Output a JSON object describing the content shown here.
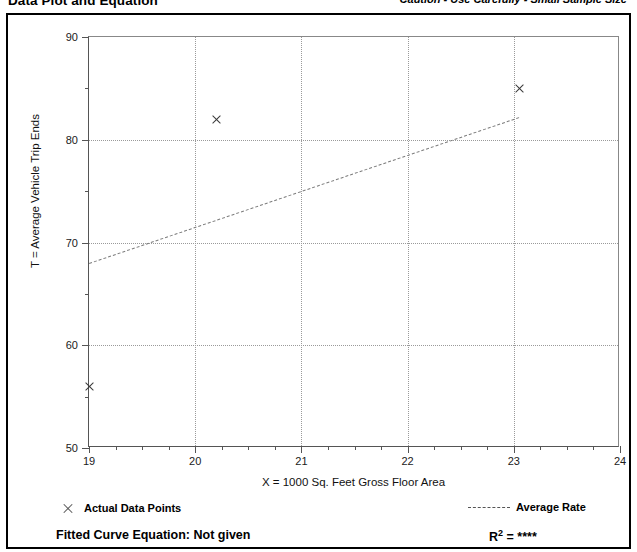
{
  "header": {
    "title": "Data Plot and Equation",
    "caution": "Caution - Use Carefully - Small Sample Size"
  },
  "legend": {
    "points_label": "Actual Data Points",
    "rate_label": "Average Rate",
    "points_marker": "x-cross-icon",
    "rate_marker": "dashed-line-icon"
  },
  "footer": {
    "equation_label": "Fitted Curve Equation:  Not given",
    "r_squared_prefix": "R",
    "r_squared_sup": "2",
    "r_squared_value": "= ****"
  },
  "chart_data": {
    "type": "scatter",
    "title": "Data Plot and Equation",
    "xlabel": "X = 1000 Sq. Feet Gross Floor Area",
    "ylabel": "T = Average Vehicle Trip Ends",
    "xlim": [
      19,
      24
    ],
    "ylim": [
      50,
      90
    ],
    "xticks": [
      19,
      20,
      21,
      22,
      23,
      24
    ],
    "xtick_labels": [
      "19",
      "20",
      "21",
      "22",
      "23",
      "24"
    ],
    "yticks": [
      50,
      60,
      70,
      80,
      90
    ],
    "ytick_labels": [
      "50",
      "60",
      "70",
      "80",
      "90"
    ],
    "x_minor_step": 0.25,
    "y_minor_step": 5,
    "grid": "dotted",
    "grid_x_values": [
      20,
      21,
      22,
      23
    ],
    "grid_y_values": [
      60,
      70,
      80
    ],
    "legend_position": "below-plot",
    "series": [
      {
        "name": "Actual Data Points",
        "type": "scatter",
        "marker": "x",
        "points": [
          {
            "x": 19.0,
            "y": 56.0
          },
          {
            "x": 20.2,
            "y": 82.0
          },
          {
            "x": 23.05,
            "y": 85.0
          }
        ]
      },
      {
        "name": "Average Rate",
        "type": "line",
        "style": "dashed",
        "points": [
          {
            "x": 19.0,
            "y": 68.0
          },
          {
            "x": 23.05,
            "y": 82.2
          }
        ]
      }
    ]
  }
}
